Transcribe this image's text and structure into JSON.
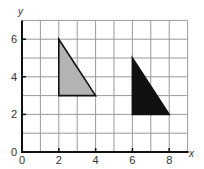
{
  "chart_data": {
    "type": "coordinate-grid",
    "title": "",
    "xlabel": "x",
    "ylabel": "y",
    "xlim": [
      0,
      9
    ],
    "ylim": [
      0,
      7
    ],
    "grid": true,
    "x_ticks": [
      0,
      2,
      4,
      6,
      8
    ],
    "y_ticks": [
      0,
      2,
      4,
      6
    ],
    "x_tick_labels": [
      "0",
      "2",
      "4",
      "6",
      "8"
    ],
    "y_tick_labels": [
      "0",
      "2",
      "4",
      "6"
    ],
    "shapes": [
      {
        "name": "gray-triangle",
        "type": "polygon",
        "vertices": [
          [
            2,
            6
          ],
          [
            2,
            3
          ],
          [
            4,
            3
          ]
        ],
        "fill": "#b3b3b3",
        "stroke": "#111111"
      },
      {
        "name": "black-triangle",
        "type": "polygon",
        "vertices": [
          [
            6,
            5
          ],
          [
            6,
            2
          ],
          [
            8,
            2
          ]
        ],
        "fill": "#111111",
        "stroke": "#111111"
      }
    ]
  },
  "colors": {
    "grid": "#9a9a9a",
    "axis": "#111111",
    "background": "#ffffff"
  }
}
